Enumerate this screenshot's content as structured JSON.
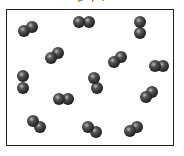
{
  "diagram": {
    "title_fragment": "p  y    l",
    "container": {
      "x": 6,
      "y": 9,
      "width": 168,
      "height": 137,
      "stroke": "#222222"
    },
    "atom_radius": 6,
    "atom_colors": {
      "highlight": "#bdbdbd",
      "mid": "#555555",
      "shadow": "#1e1e1e"
    },
    "molecules": [
      {
        "id": 1,
        "a": [
          24,
          31
        ],
        "b": [
          32,
          27
        ]
      },
      {
        "id": 2,
        "a": [
          79,
          22
        ],
        "b": [
          89,
          22
        ]
      },
      {
        "id": 3,
        "a": [
          140,
          22
        ],
        "b": [
          140,
          33
        ]
      },
      {
        "id": 4,
        "a": [
          51,
          58
        ],
        "b": [
          58,
          53
        ]
      },
      {
        "id": 5,
        "a": [
          114,
          62
        ],
        "b": [
          121,
          57
        ]
      },
      {
        "id": 6,
        "a": [
          155,
          66
        ],
        "b": [
          163,
          66
        ]
      },
      {
        "id": 7,
        "a": [
          23,
          76
        ],
        "b": [
          23,
          88
        ]
      },
      {
        "id": 8,
        "a": [
          94,
          78
        ],
        "b": [
          97,
          88
        ]
      },
      {
        "id": 9,
        "a": [
          59,
          99
        ],
        "b": [
          68,
          99
        ]
      },
      {
        "id": 10,
        "a": [
          146,
          97
        ],
        "b": [
          152,
          92
        ]
      },
      {
        "id": 11,
        "a": [
          33,
          121
        ],
        "b": [
          40,
          127
        ]
      },
      {
        "id": 12,
        "a": [
          88,
          127
        ],
        "b": [
          96,
          132
        ]
      },
      {
        "id": 13,
        "a": [
          130,
          131
        ],
        "b": [
          137,
          127
        ]
      }
    ]
  }
}
